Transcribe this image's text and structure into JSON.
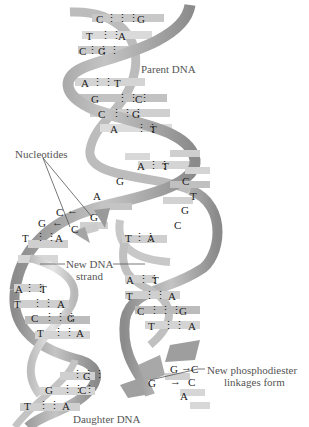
{
  "diagram": {
    "labels": {
      "parent": "Parent DNA",
      "nucleotides": "Nucleotides",
      "new_strand_1": "New DNA",
      "new_strand_2": "strand",
      "phospho_1": "New phosphodiester",
      "phospho_2": "linkages form",
      "daughter": "Daughter DNA"
    },
    "parent_pairs": [
      {
        "left": "C",
        "right": "G",
        "bonds": 3,
        "y": 20
      },
      {
        "left": "T",
        "right": "A",
        "bonds": 2,
        "y": 37
      },
      {
        "left": "C",
        "right": "G",
        "bonds": 3,
        "y": 52
      },
      {
        "left": "A",
        "right": "T",
        "bonds": 2,
        "y": 84
      },
      {
        "left": "G",
        "right": "C",
        "bonds": 3,
        "y": 100
      },
      {
        "left": "C",
        "right": "G",
        "bonds": 3,
        "y": 115
      },
      {
        "left": "A",
        "right": "T",
        "bonds": 2,
        "y": 130
      },
      {
        "left": "A",
        "right": "T",
        "bonds": 2,
        "y": 167
      }
    ],
    "fork_unpaired_left": [
      "G",
      "A"
    ],
    "fork_unpaired_right": [
      "C",
      "T",
      "G",
      "C"
    ],
    "incoming_nucleotides": [
      {
        "base": "C",
        "pair": "G"
      },
      {
        "base": "G",
        "pair": "C"
      }
    ],
    "left_daughter_pairs": [
      {
        "left": "T",
        "right": "A",
        "bonds": 2
      },
      {
        "left": "A",
        "right": "T",
        "bonds": 2
      },
      {
        "left": "T",
        "right": "A",
        "bonds": 2
      },
      {
        "left": "C",
        "right": "G",
        "bonds": 3
      },
      {
        "left": "T",
        "right": "A",
        "bonds": 2
      },
      {
        "left": "",
        "right": "C",
        "bonds": 3
      },
      {
        "left": "G",
        "right": "C",
        "bonds": 3
      },
      {
        "left": "T",
        "right": "A",
        "bonds": 2
      }
    ],
    "right_daughter_pairs": [
      {
        "left": "T",
        "right": "A",
        "bonds": 2
      },
      {
        "left": "A",
        "right": "T",
        "bonds": 2
      },
      {
        "left": "T",
        "right": "A",
        "bonds": 2
      },
      {
        "left": "C",
        "right": "G",
        "bonds": 3
      },
      {
        "left": "T",
        "right": "A",
        "bonds": 2
      }
    ],
    "right_daughter_new": [
      {
        "left": "G",
        "right": "C"
      },
      {
        "left": "G",
        "right": "C"
      },
      {
        "left": "",
        "right": "A"
      }
    ]
  }
}
